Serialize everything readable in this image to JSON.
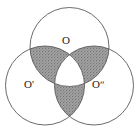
{
  "figure": {
    "name": "three-overlapping-circles-venn-diagram",
    "canvas": {
      "width": 139,
      "height": 135
    },
    "background_color": "#ffffff",
    "stroke_color": "#595959",
    "stroke_width": 0.9,
    "shade_color": "#9a9a9a",
    "shade_texture": "stipple-dots",
    "labels": {
      "top": "O",
      "left": "O'",
      "right": "Oʺ"
    },
    "circles": [
      {
        "name": "top-circle",
        "cx": 69.5,
        "cy": 47.0,
        "r": 39.5
      },
      {
        "name": "left-circle",
        "cx": 45.0,
        "cy": 85.5,
        "r": 39.5
      },
      {
        "name": "right-circle",
        "cx": 94.0,
        "cy": 85.5,
        "r": 39.5
      }
    ],
    "vertices": [
      {
        "name": "O",
        "x": 69.5,
        "y": 52.0
      },
      {
        "name": "O'",
        "x": 44.5,
        "y": 85.0
      },
      {
        "name": "Oʺ",
        "x": 94.5,
        "y": 85.0
      }
    ],
    "shaded_regions": [
      {
        "name": "upper-left-lens",
        "description": "lens between top circle and left circle, outside right circle"
      },
      {
        "name": "upper-right-lens",
        "description": "lens between top circle and right circle, outside left circle"
      },
      {
        "name": "lower-lens",
        "description": "lens between left circle and right circle, outside top circle"
      }
    ],
    "white_region": {
      "name": "central-reuleaux-triangle",
      "description": "intersection of all three circles, unshaded"
    }
  }
}
